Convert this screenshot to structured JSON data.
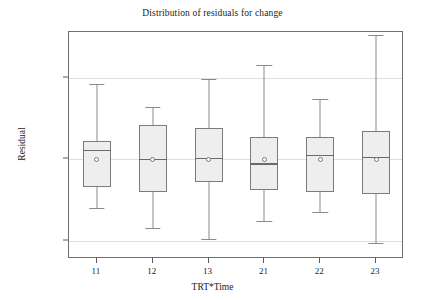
{
  "chart_data": {
    "type": "box",
    "title": "Distribution of residuals for change",
    "xlabel": "TRT*Time",
    "ylabel": "Residual",
    "categories": [
      "11",
      "12",
      "13",
      "21",
      "22",
      "23"
    ],
    "ylim": [
      -12.2,
      15.6
    ],
    "yticks": [
      10,
      0,
      -10
    ],
    "ytick_labels": [
      "10",
      "0",
      "-10"
    ],
    "grid": true,
    "legend": "none",
    "boxes": [
      {
        "category": "11",
        "min": -5.9,
        "q1": -3.4,
        "median": 1.2,
        "q3": 2.3,
        "max": 9.2,
        "mean": 0.0
      },
      {
        "category": "12",
        "min": -8.4,
        "q1": -4.0,
        "median": 0.1,
        "q3": 4.2,
        "max": 6.4,
        "mean": 0.0
      },
      {
        "category": "13",
        "min": -9.8,
        "q1": -2.8,
        "median": 0.2,
        "q3": 3.9,
        "max": 9.9,
        "mean": 0.0
      },
      {
        "category": "21",
        "min": -7.5,
        "q1": -3.7,
        "median": -0.5,
        "q3": 2.7,
        "max": 11.6,
        "mean": 0.0
      },
      {
        "category": "22",
        "min": -6.5,
        "q1": -4.0,
        "median": 0.5,
        "q3": 2.7,
        "max": 7.4,
        "mean": 0.0
      },
      {
        "category": "23",
        "min": -10.2,
        "q1": -4.3,
        "median": 0.3,
        "q3": 3.5,
        "max": 15.2,
        "mean": 0.0
      }
    ],
    "colors": {
      "box_fill": "#eeeeee",
      "box_edge": "#7b7b7b",
      "median": "#6a6a6a",
      "whisker": "#8a8a8a",
      "grid": "#dedede",
      "frame": "#6e6e6e",
      "text": "#1c1c1c",
      "background": "#ffffff"
    }
  }
}
